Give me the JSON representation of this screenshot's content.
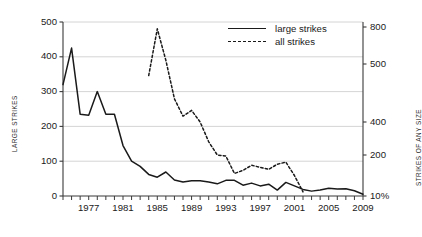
{
  "chart_data": {
    "type": "line",
    "title": "",
    "xlabel": "",
    "ylabel": "LARGE STRIKES",
    "y2label": "STRIKES OF ANY SIZE",
    "grid": true,
    "legend_position": "top-center",
    "xlim": [
      1974,
      2009
    ],
    "ylim": [
      0,
      500
    ],
    "x_ticks_all": [
      1974,
      1975,
      1976,
      1977,
      1978,
      1979,
      1980,
      1981,
      1982,
      1983,
      1984,
      1985,
      1986,
      1987,
      1988,
      1989,
      1990,
      1991,
      1992,
      1993,
      1994,
      1995,
      1996,
      1997,
      1998,
      1999,
      2000,
      2001,
      2002,
      2003,
      2004,
      2005,
      2006,
      2007,
      2008,
      2009
    ],
    "x_tick_labels": [
      "1977",
      "1981",
      "1985",
      "1989",
      "1993",
      "1997",
      "2001",
      "2005",
      "2009"
    ],
    "x_tick_label_values": [
      1977,
      1981,
      1985,
      1989,
      1993,
      1997,
      2001,
      2005,
      2009
    ],
    "y_left_ticks": [
      0,
      100,
      200,
      300,
      400,
      500
    ],
    "y_left_tick_labels": [
      "0",
      "100",
      "200",
      "300",
      "400",
      "500"
    ],
    "y_right_ticks": [
      200,
      400,
      500,
      800,
      1000
    ],
    "y_right_tick_labels": [
      "10%",
      "200",
      "400",
      "500",
      "800",
      "1,000"
    ],
    "y_right_scale": "nonlinear",
    "series": [
      {
        "name": "large strikes",
        "style": "solid",
        "axis": "left",
        "color": "#1a1a1a",
        "x": [
          1974,
          1975,
          1976,
          1977,
          1978,
          1979,
          1980,
          1981,
          1982,
          1983,
          1984,
          1985,
          1986,
          1987,
          1988,
          1989,
          1990,
          1991,
          1992,
          1993,
          1994,
          1995,
          1996,
          1997,
          1998,
          1999,
          2000,
          2001,
          2002,
          2003,
          2004,
          2005,
          2006,
          2007,
          2008,
          2009
        ],
        "values": [
          320,
          425,
          235,
          232,
          300,
          235,
          235,
          145,
          100,
          85,
          62,
          54,
          69,
          46,
          40,
          44,
          44,
          40,
          35,
          45,
          45,
          31,
          37,
          29,
          34,
          17,
          39,
          29,
          19,
          14,
          17,
          22,
          20,
          21,
          15,
          5
        ]
      },
      {
        "name": "all strikes",
        "style": "dashed",
        "axis": "right",
        "color": "#1a1a1a",
        "x": [
          1984,
          1985,
          1986,
          1987,
          1988,
          1989,
          1990,
          1991,
          1992,
          1993,
          1994,
          1995,
          1996,
          1997,
          1998,
          1999,
          2000,
          2001,
          2002
        ],
        "values": [
          740,
          990,
          820,
          620,
          530,
          560,
          500,
          440,
          400,
          395,
          310,
          325,
          350,
          340,
          330,
          355,
          365,
          300,
          220
        ]
      }
    ]
  },
  "axes": {
    "left_title": "LARGE STRIKES",
    "right_title": "STRIKES OF ANY SIZE"
  },
  "legend": {
    "items": [
      {
        "label": "large strikes",
        "style": "solid"
      },
      {
        "label": "all strikes",
        "style": "dashed"
      }
    ]
  },
  "caption": {
    "text": ""
  }
}
